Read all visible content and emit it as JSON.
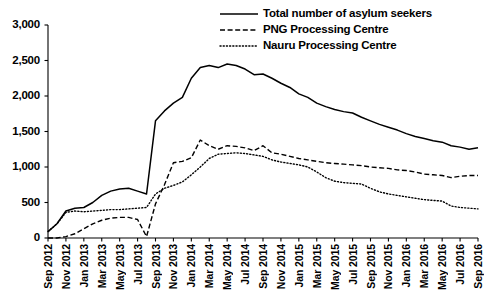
{
  "chart_data": {
    "type": "line",
    "title": "",
    "xlabel": "",
    "ylabel": "",
    "ylim": [
      0,
      3000
    ],
    "yticks": [
      "0",
      "500",
      "1,000",
      "1,500",
      "2,000",
      "2,500",
      "3,000"
    ],
    "ytick_values": [
      0,
      500,
      1000,
      1500,
      2000,
      2500,
      3000
    ],
    "grid": false,
    "legend_position": "top-right",
    "categories": [
      "Sep 2012",
      "Oct 2012",
      "Nov 2012",
      "Dec 2012",
      "Jan 2013",
      "Feb 2013",
      "Mar 2013",
      "Apr 2013",
      "May 2013",
      "Jun 2013",
      "Jul 2013",
      "Aug 2013",
      "Sep 2013",
      "Oct 2013",
      "Nov 2013",
      "Dec 2013",
      "Jan 2014",
      "Feb 2014",
      "Mar 2014",
      "Apr 2014",
      "May 2014",
      "Jun 2014",
      "Jul 2014",
      "Aug 2014",
      "Sep 2014",
      "Oct 2014",
      "Nov 2014",
      "Dec 2014",
      "Jan 2015",
      "Feb 2015",
      "Mar 2015",
      "Apr 2015",
      "May 2015",
      "Jun 2015",
      "Jul 2015",
      "Aug 2015",
      "Sep 2015",
      "Oct 2015",
      "Nov 2015",
      "Dec 2015",
      "Jan 2016",
      "Feb 2016",
      "Mar 2016",
      "Apr 2016",
      "May 2016",
      "Jun 2016",
      "Jul 2016",
      "Aug 2016",
      "Sep 2016"
    ],
    "xticklabels": [
      "Sep 2012",
      "Nov 2012",
      "Jan 2013",
      "Mar 2013",
      "May 2013",
      "Jul 2013",
      "Sep 2013",
      "Nov 2013",
      "Jan 2014",
      "Mar 2014",
      "May 2014",
      "Jul 2014",
      "Sep 2014",
      "Nov 2014",
      "Jan 2015",
      "Mar 2015",
      "May 2015",
      "Jul 2015",
      "Sep 2015",
      "Nov 2015",
      "Jan 2016",
      "Mar 2016",
      "May 2016",
      "Jul 2016",
      "Sep 2016"
    ],
    "series": [
      {
        "name": "Total number of asylum seekers",
        "style": "solid",
        "color": "#000000",
        "values": [
          90,
          200,
          380,
          420,
          430,
          500,
          600,
          660,
          690,
          700,
          660,
          620,
          1650,
          1790,
          1900,
          1980,
          2250,
          2400,
          2430,
          2400,
          2450,
          2430,
          2380,
          2300,
          2310,
          2250,
          2180,
          2120,
          2030,
          1980,
          1900,
          1850,
          1810,
          1780,
          1760,
          1700,
          1650,
          1600,
          1560,
          1520,
          1470,
          1430,
          1400,
          1370,
          1350,
          1300,
          1280,
          1250,
          1270
        ]
      },
      {
        "name": "PNG Processing Centre",
        "style": "dashed",
        "color": "#000000",
        "values": [
          0,
          0,
          20,
          60,
          130,
          200,
          250,
          280,
          290,
          290,
          260,
          20,
          480,
          750,
          1060,
          1080,
          1130,
          1380,
          1300,
          1250,
          1300,
          1290,
          1270,
          1230,
          1300,
          1200,
          1180,
          1150,
          1120,
          1100,
          1080,
          1060,
          1050,
          1040,
          1030,
          1020,
          1000,
          990,
          980,
          960,
          950,
          930,
          900,
          890,
          880,
          850,
          870,
          880,
          880
        ]
      },
      {
        "name": "Nauru Processing Centre",
        "style": "dotted",
        "color": "#000000",
        "values": [
          90,
          200,
          360,
          380,
          370,
          380,
          390,
          400,
          400,
          410,
          420,
          430,
          620,
          700,
          740,
          790,
          890,
          1000,
          1120,
          1180,
          1190,
          1200,
          1190,
          1170,
          1150,
          1100,
          1070,
          1050,
          1030,
          1000,
          930,
          850,
          800,
          780,
          770,
          760,
          700,
          650,
          620,
          600,
          580,
          560,
          540,
          530,
          520,
          450,
          430,
          420,
          410
        ]
      }
    ]
  },
  "legend": {
    "items": [
      {
        "label": "Total number of asylum seekers",
        "style": "solid"
      },
      {
        "label": "PNG Processing Centre",
        "style": "dashed"
      },
      {
        "label": "Nauru Processing Centre",
        "style": "dotted"
      }
    ]
  }
}
